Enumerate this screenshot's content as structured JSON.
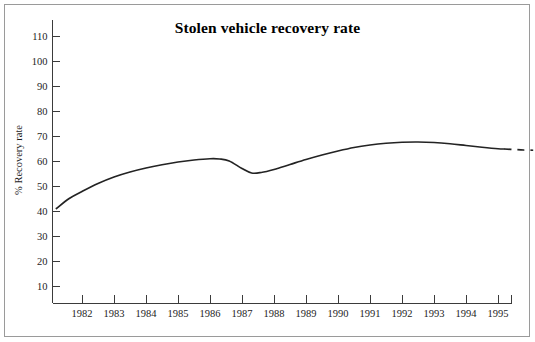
{
  "chart_data": {
    "type": "line",
    "title": "Stolen vehicle recovery rate",
    "xlabel": "",
    "ylabel": "% Recovery rate",
    "ylim": [
      0,
      115
    ],
    "xlim": [
      1981.2,
      1996.1
    ],
    "grid": false,
    "legend": null,
    "y_ticks": [
      10,
      20,
      30,
      40,
      50,
      60,
      70,
      80,
      90,
      100,
      110
    ],
    "y_tick_labels": [
      "10",
      "20",
      "30",
      "40",
      "50",
      "60",
      "70",
      "80",
      "90",
      "100",
      "110"
    ],
    "x_ticks": [
      1982,
      1983,
      1984,
      1985,
      1986,
      1987,
      1988,
      1989,
      1990,
      1991,
      1992,
      1993,
      1994,
      1995
    ],
    "x_tick_labels": [
      "1982",
      "1983",
      "1984",
      "1985",
      "1986",
      "1987",
      "1988",
      "1989",
      "1990",
      "1991",
      "1992",
      "1993",
      "1994",
      "1995"
    ],
    "series": [
      {
        "name": "Recovery rate (actual)",
        "style": "solid",
        "x": [
          1981.2,
          1981.6,
          1982.0,
          1982.5,
          1983.0,
          1983.5,
          1984.0,
          1984.5,
          1985.0,
          1985.5,
          1986.0,
          1986.3,
          1986.6,
          1987.0,
          1987.3,
          1987.6,
          1988.0,
          1988.5,
          1989.0,
          1989.5,
          1990.0,
          1990.5,
          1991.0,
          1991.5,
          1992.0,
          1992.5,
          1993.0,
          1993.5,
          1994.0,
          1994.5,
          1995.0,
          1995.2
        ],
        "y": [
          41.0,
          45.0,
          47.8,
          51.0,
          53.6,
          55.6,
          57.2,
          58.5,
          59.6,
          60.4,
          60.9,
          60.8,
          60.0,
          57.0,
          55.2,
          55.4,
          56.6,
          58.6,
          60.6,
          62.4,
          64.0,
          65.4,
          66.4,
          67.1,
          67.5,
          67.6,
          67.4,
          66.9,
          66.2,
          65.5,
          64.9,
          64.8
        ]
      },
      {
        "name": "Recovery rate (projected)",
        "style": "dashed",
        "x": [
          1995.2,
          1995.5,
          1995.8,
          1996.1
        ],
        "y": [
          64.8,
          64.6,
          64.4,
          64.3
        ]
      }
    ],
    "annotations": [
      "Solid line shows recorded recovery rate 1981-1995",
      "Dashed line at right shows a short projected continuation beyond 1995"
    ]
  },
  "figure": {
    "background_color": "#ffffff",
    "line_color": "#232323",
    "axis_color": "#3b3b3b",
    "frame_color": "#9a9a9a",
    "text_color": "#1a1a1a"
  }
}
